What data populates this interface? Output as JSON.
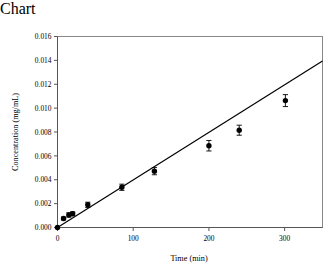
{
  "chart_data": {
    "type": "scatter",
    "title": "",
    "xlabel": "Time (min)",
    "ylabel": "Concentration (mg/mL)",
    "xlim": [
      0,
      350
    ],
    "ylim": [
      0,
      0.016
    ],
    "xticks": [
      0,
      100,
      200,
      300
    ],
    "xticklabels": [
      "0",
      "100",
      "200",
      "300"
    ],
    "yticks": [
      0.0,
      0.002,
      0.004,
      0.006,
      0.008,
      0.01,
      0.012,
      0.014,
      0.016
    ],
    "yticklabels": [
      "0.000",
      "0.002",
      "0.004",
      "0.006",
      "0.008",
      "0.010",
      "0.012",
      "0.014",
      "0.016"
    ],
    "grid": false,
    "legend": null,
    "marker": "filled-circle",
    "marker_color": "#000000",
    "line_color": "#000000",
    "x": [
      0,
      8,
      15,
      20,
      40,
      85,
      128,
      200,
      240,
      301
    ],
    "y": [
      0.0,
      0.00075,
      0.00105,
      0.00115,
      0.0019,
      0.00337,
      0.00472,
      0.00685,
      0.00815,
      0.01063
    ],
    "yerr": [
      0.0,
      0.00012,
      0.00018,
      0.00016,
      0.00022,
      0.00026,
      0.0003,
      0.00044,
      0.00042,
      0.0005
    ],
    "series": [
      {
        "name": "measured concentration",
        "x": [
          0,
          8,
          15,
          20,
          40,
          85,
          128,
          200,
          240,
          301
        ],
        "values": [
          0.0,
          0.00075,
          0.00105,
          0.00115,
          0.0019,
          0.00337,
          0.00472,
          0.00685,
          0.00815,
          0.01063
        ],
        "yerr": [
          0.0,
          0.00012,
          0.00018,
          0.00016,
          0.00022,
          0.00026,
          0.0003,
          0.00044,
          0.00042,
          0.0005
        ]
      },
      {
        "name": "linear fit",
        "type": "line",
        "x": [
          0,
          350
        ],
        "values": [
          0.0,
          0.01395
        ]
      }
    ],
    "fit": {
      "slope": 3.986e-05,
      "intercept": 0.0
    }
  }
}
